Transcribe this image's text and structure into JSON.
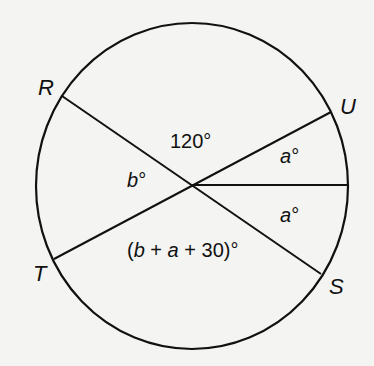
{
  "diagram": {
    "type": "circle-with-chords",
    "stroke_color": "#111111",
    "background_color": "#f4f4f2",
    "points": {
      "R": "R",
      "U": "U",
      "T": "T",
      "S": "S"
    },
    "angles": {
      "top": "120°",
      "left_var": "b",
      "upper_right_var": "a",
      "lower_right_var": "a",
      "bottom_open": "(",
      "bottom_b": "b",
      "bottom_plus1": " + ",
      "bottom_a": "a",
      "bottom_rest": " + 30)°",
      "degree": "°"
    }
  }
}
